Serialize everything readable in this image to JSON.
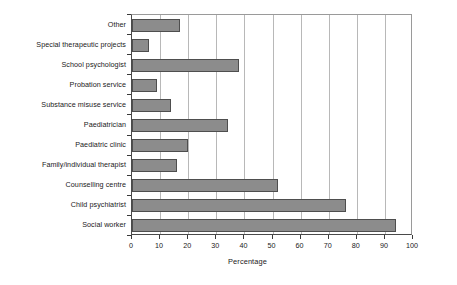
{
  "chart_data": {
    "type": "bar",
    "orientation": "horizontal",
    "title": "",
    "xlabel": "Percentage",
    "ylabel": "",
    "xlim": [
      0,
      100
    ],
    "xticks": [
      0,
      10,
      20,
      30,
      40,
      50,
      60,
      70,
      80,
      90,
      100
    ],
    "grid": true,
    "legend": false,
    "categories": [
      "Other",
      "Special therapeutic projects",
      "School psychologist",
      "Probation service",
      "Substance misuse service",
      "Paediatrician",
      "Paediatric clinic",
      "Family/individual therapist",
      "Counselling centre",
      "Child psychiatrist",
      "Social worker"
    ],
    "values": [
      17,
      6,
      38,
      9,
      14,
      34,
      20,
      16,
      52,
      76,
      94
    ],
    "bar_color": "#8c8c8c",
    "bar_border_color": "#4e4e4e",
    "gridline_color": "#b8b8b8",
    "axis_color": "#4a4a4a",
    "background_color": "#ffffff"
  }
}
